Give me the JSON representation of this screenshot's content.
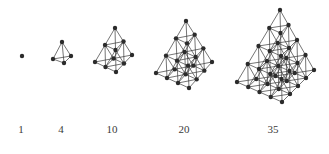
{
  "diagram": {
    "colors": {
      "node": "#2b2b2b",
      "edge": "#3a3a3a",
      "background": "#ffffff",
      "label": "#3a3a3a"
    },
    "node_radius": 2.2,
    "figures": [
      {
        "label": "1",
        "layers": 1,
        "apex": [
          22,
          56
        ],
        "left": [
          22,
          56
        ],
        "right": [
          22,
          56
        ],
        "front": [
          22,
          56
        ],
        "label_x": 21
      },
      {
        "label": "4",
        "layers": 2,
        "apex": [
          62,
          42
        ],
        "left": [
          53,
          59
        ],
        "right": [
          71,
          56
        ],
        "front": [
          64,
          63
        ],
        "label_x": 61
      },
      {
        "label": "10",
        "layers": 3,
        "apex": [
          115,
          28
        ],
        "left": [
          95,
          62
        ],
        "right": [
          132,
          55
        ],
        "front": [
          116,
          72
        ],
        "label_x": 112
      },
      {
        "label": "20",
        "layers": 4,
        "apex": [
          186,
          21
        ],
        "left": [
          156,
          73
        ],
        "right": [
          212,
          62
        ],
        "front": [
          189,
          88
        ],
        "label_x": 184
      },
      {
        "label": "35",
        "layers": 5,
        "apex": [
          280,
          10
        ],
        "left": [
          237,
          82
        ],
        "right": [
          314,
          70
        ],
        "front": [
          282,
          102
        ],
        "label_x": 273
      }
    ]
  }
}
